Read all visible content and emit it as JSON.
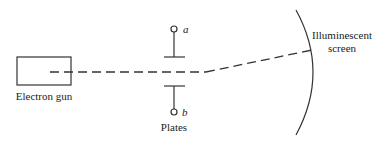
{
  "diagram": {
    "type": "cathode-ray-tube-schematic",
    "colors": {
      "stroke": "#333333",
      "text": "#222222",
      "background": "#ffffff"
    },
    "components": {
      "electron_gun": {
        "label": "Electron gun"
      },
      "plates": {
        "label": "Plates",
        "terminal_top": "a",
        "terminal_bottom": "b"
      },
      "screen": {
        "label_line1": "Illuminescent",
        "label_line2": "screen"
      }
    },
    "beam": {
      "style": "dashed",
      "deflected": true
    }
  }
}
